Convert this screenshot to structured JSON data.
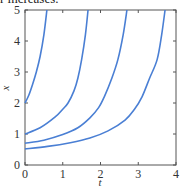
{
  "caption": {
    "text": "r increases."
  },
  "chart_data": {
    "type": "line",
    "title": "",
    "xlabel": "t",
    "ylabel": "x",
    "xlim": [
      0,
      4
    ],
    "ylim": [
      0,
      5
    ],
    "xticks": [
      "0",
      "1",
      "2",
      "3",
      "4"
    ],
    "yticks": [
      "0",
      "1",
      "2",
      "3",
      "4",
      "5"
    ],
    "grid": false,
    "legend": null,
    "line_color": "#4a7fd4",
    "series": [
      {
        "name": "x0 = 2",
        "x": [
          0,
          0.1,
          0.2,
          0.3,
          0.4,
          0.5,
          0.58
        ],
        "y": [
          2.0,
          2.25,
          2.6,
          3.0,
          3.5,
          4.2,
          5.0
        ]
      },
      {
        "name": "x0 = 1",
        "x": [
          0,
          0.4,
          0.8,
          1.0,
          1.14,
          1.3,
          1.4,
          1.5,
          1.6,
          1.67
        ],
        "y": [
          1.0,
          1.2,
          1.55,
          1.8,
          2.0,
          2.4,
          2.8,
          3.4,
          4.2,
          5.0
        ]
      },
      {
        "name": "x0 = 0.7",
        "x": [
          0,
          0.5,
          1.0,
          1.4,
          1.72,
          1.95,
          2.1,
          2.3,
          2.46,
          2.6,
          2.7
        ],
        "y": [
          0.7,
          0.8,
          0.98,
          1.2,
          1.52,
          1.85,
          2.2,
          2.8,
          3.4,
          4.2,
          5.0
        ]
      },
      {
        "name": "x0 = 0.5",
        "x": [
          0,
          0.6,
          1.2,
          1.72,
          2.2,
          2.65,
          2.9,
          3.1,
          3.3,
          3.5,
          3.62,
          3.71
        ],
        "y": [
          0.52,
          0.6,
          0.72,
          0.87,
          1.1,
          1.45,
          1.8,
          2.2,
          2.8,
          3.4,
          4.2,
          5.0
        ]
      }
    ]
  }
}
